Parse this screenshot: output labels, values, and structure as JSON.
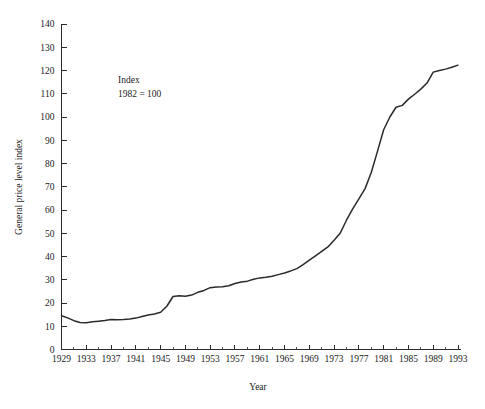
{
  "chart_data": {
    "type": "line",
    "title": "",
    "xlabel": "Year",
    "ylabel": "General price level index",
    "xlim": [
      1929,
      1993
    ],
    "ylim": [
      0,
      140
    ],
    "grid": false,
    "legend": null,
    "annotations": [
      {
        "line1": "Index",
        "line2": "1982 = 100"
      }
    ],
    "ytick_labels": [
      "0",
      "10",
      "20",
      "30",
      "40",
      "50",
      "60",
      "70",
      "80",
      "90",
      "100",
      "110",
      "120",
      "130",
      "140"
    ],
    "ytick_values": [
      0,
      10,
      20,
      30,
      40,
      50,
      60,
      70,
      80,
      90,
      100,
      110,
      120,
      130,
      140
    ],
    "xtick_labels": [
      "1929",
      "1933",
      "1937",
      "1941",
      "1945",
      "1949",
      "1953",
      "1957",
      "1961",
      "1965",
      "1969",
      "1973",
      "1977",
      "1981",
      "1985",
      "1989",
      "1993"
    ],
    "xtick_values": [
      1929,
      1933,
      1937,
      1941,
      1945,
      1949,
      1953,
      1957,
      1961,
      1965,
      1969,
      1973,
      1977,
      1981,
      1985,
      1989,
      1993
    ],
    "xtick_minor_values": [
      1931,
      1935,
      1939,
      1943,
      1947,
      1951,
      1955,
      1959,
      1963,
      1967,
      1971,
      1975,
      1979,
      1983,
      1987,
      1991
    ],
    "series": [
      {
        "name": "General price level index",
        "color": "#2a2a2a",
        "x": [
          1929,
          1930,
          1931,
          1932,
          1933,
          1934,
          1935,
          1936,
          1937,
          1938,
          1939,
          1940,
          1941,
          1942,
          1943,
          1944,
          1945,
          1946,
          1947,
          1948,
          1949,
          1950,
          1951,
          1952,
          1953,
          1954,
          1955,
          1956,
          1957,
          1958,
          1959,
          1960,
          1961,
          1962,
          1963,
          1964,
          1965,
          1966,
          1967,
          1968,
          1969,
          1970,
          1971,
          1972,
          1973,
          1974,
          1975,
          1976,
          1977,
          1978,
          1979,
          1980,
          1981,
          1982,
          1983,
          1984,
          1985,
          1986,
          1987,
          1988,
          1989,
          1990,
          1991,
          1992,
          1993
        ],
        "values": [
          14.5,
          13.6,
          12.4,
          11.6,
          11.5,
          11.9,
          12.2,
          12.5,
          12.9,
          12.8,
          12.9,
          13.1,
          13.5,
          14.2,
          14.8,
          15.3,
          16.0,
          18.6,
          22.8,
          23.1,
          22.9,
          23.4,
          24.6,
          25.4,
          26.6,
          26.9,
          27.0,
          27.4,
          28.4,
          29.0,
          29.4,
          30.2,
          30.8,
          31.1,
          31.5,
          32.2,
          32.9,
          33.8,
          34.8,
          36.5,
          38.4,
          40.3,
          42.2,
          44.1,
          47.0,
          50.1,
          55.6,
          60.5,
          64.8,
          69.2,
          76.1,
          85.2,
          94.5,
          100.0,
          104.2,
          105.0,
          107.7,
          109.8,
          112.0,
          114.6,
          119.3,
          120.0,
          120.6,
          121.4,
          122.3
        ]
      }
    ]
  },
  "figure": {
    "background": "#ffffff",
    "line_color": "#2a2a2a",
    "axis_color": "#2b2b2b",
    "text_color": "#1a1a1a"
  }
}
